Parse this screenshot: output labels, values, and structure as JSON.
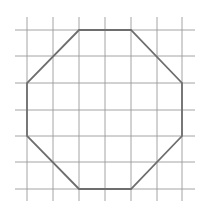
{
  "diagram": {
    "type": "octagon-on-grid",
    "colors": {
      "background": "#ffffff",
      "grid_line": "#9a9a9a",
      "octagon_stroke": "#6e6e6e"
    },
    "grid": {
      "vertical_x": [
        27,
        53,
        79,
        105,
        131,
        157,
        182
      ],
      "horizontal_y": [
        30,
        56,
        83,
        110,
        136,
        162,
        189
      ],
      "v_extent": [
        17,
        201
      ],
      "h_extent": [
        15,
        195
      ]
    },
    "octagon": {
      "vertices": [
        [
          79,
          30
        ],
        [
          131,
          30
        ],
        [
          182,
          83
        ],
        [
          182,
          136
        ],
        [
          131,
          189
        ],
        [
          79,
          189
        ],
        [
          27,
          136
        ],
        [
          27,
          83
        ]
      ]
    }
  }
}
